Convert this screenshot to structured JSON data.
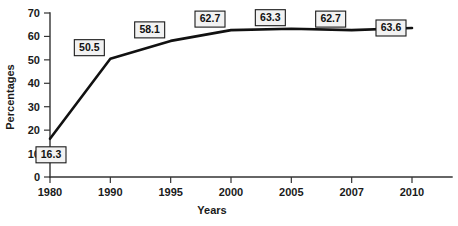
{
  "chart_data": {
    "type": "line",
    "title": "",
    "xlabel": "Years",
    "ylabel": "Percentages",
    "categories": [
      "1980",
      "1990",
      "1995",
      "2000",
      "2005",
      "2007",
      "2010"
    ],
    "values": [
      16.3,
      50.5,
      58.1,
      62.7,
      63.3,
      62.7,
      63.6
    ],
    "data_labels": [
      "16.3",
      "50.5",
      "58.1",
      "62.7",
      "63.3",
      "62.7",
      "63.6"
    ],
    "ylim": [
      0,
      70
    ],
    "ytick_labels": [
      "0",
      "10",
      "20",
      "30",
      "40",
      "50",
      "60",
      "70"
    ],
    "ytick_values": [
      0,
      10,
      20,
      30,
      40,
      50,
      60,
      70
    ],
    "grid": false,
    "legend": false,
    "legend_position": "none",
    "series": [
      {
        "name": "Percentages",
        "color": "#111111",
        "values": [
          16.3,
          50.5,
          58.1,
          62.7,
          63.3,
          62.7,
          63.6
        ]
      }
    ],
    "label_box_fill": "#f2f2f2",
    "label_box_stroke": "#1a1a1a",
    "axis_color": "#333333",
    "background_color": "#ffffff"
  }
}
